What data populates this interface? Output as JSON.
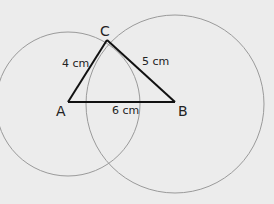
{
  "diagram": {
    "type": "triangle-construction",
    "background": "#ececec",
    "line_color": "#111111",
    "circle_color": "#9a9a9a",
    "vertices": {
      "A": {
        "label": "A",
        "x": 68,
        "y": 102
      },
      "B": {
        "label": "B",
        "x": 175,
        "y": 102
      },
      "C": {
        "label": "C",
        "x": 107,
        "y": 40
      }
    },
    "sides": {
      "AB": {
        "label": "6 cm"
      },
      "BC": {
        "label": "5 cm"
      },
      "AC": {
        "label": "4 cm"
      }
    },
    "circles": [
      {
        "center": "A",
        "radius_label": "4 cm"
      },
      {
        "center": "B",
        "radius_label": "5 cm"
      }
    ]
  }
}
